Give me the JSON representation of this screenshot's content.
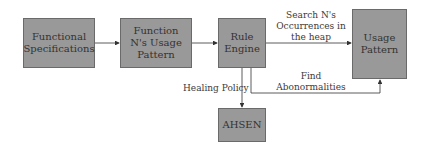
{
  "diagram": {
    "nodes": [
      {
        "id": "functional-specifications",
        "label": "Functional Specifications"
      },
      {
        "id": "function-usage-pattern",
        "label": "Function N's Usage Pattern"
      },
      {
        "id": "rule-engine",
        "label": "Rule Engine"
      },
      {
        "id": "usage-pattern",
        "label": "Usage Pattern"
      },
      {
        "id": "ahsen",
        "label": "AHSEN"
      }
    ],
    "edges": [
      {
        "from": "functional-specifications",
        "to": "function-usage-pattern",
        "label": ""
      },
      {
        "from": "function-usage-pattern",
        "to": "rule-engine",
        "label": ""
      },
      {
        "from": "rule-engine",
        "to": "usage-pattern",
        "label": "Search N's Occurrences in the heap"
      },
      {
        "from": "rule-engine",
        "to": "usage-pattern",
        "label": "Find Abonormalities"
      },
      {
        "from": "rule-engine",
        "to": "ahsen",
        "label": "Healing Policy"
      }
    ],
    "colors": {
      "box_fill": "#999999",
      "box_border": "#6a6a6a",
      "arrow": "#333333"
    }
  }
}
